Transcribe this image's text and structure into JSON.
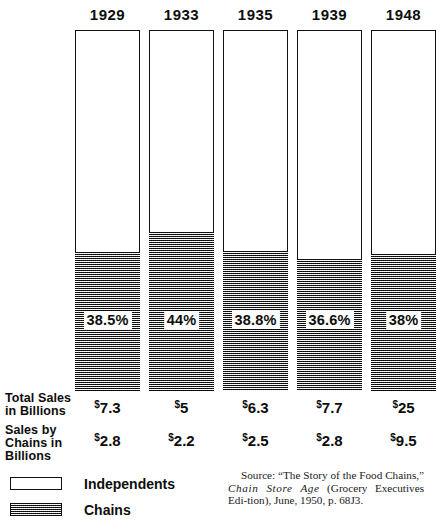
{
  "chart_data": {
    "type": "bar",
    "title": "",
    "xlabel": "",
    "ylabel": "",
    "categories": [
      "1929",
      "1933",
      "1935",
      "1939",
      "1948"
    ],
    "series": [
      {
        "name": "Independents",
        "note": "unshaded upper portion of each bar",
        "values": [
          61.5,
          56.0,
          61.2,
          63.4,
          62.0
        ]
      },
      {
        "name": "Chains",
        "note": "stippled lower portion of each bar, labelled with percent",
        "values": [
          38.5,
          44.0,
          38.8,
          36.6,
          38.0
        ]
      }
    ],
    "percent_labels": [
      "38.5%",
      "44%",
      "38.8%",
      "36.6%",
      "38%"
    ],
    "ylim": [
      0,
      100
    ],
    "grid": false,
    "legend_position": "bottom-left",
    "total_sales_billions": [
      "$7.3",
      "$5",
      "$6.3",
      "$7.7",
      "$25"
    ],
    "chain_sales_billions": [
      "$2.8",
      "$2.2",
      "$2.5",
      "$2.8",
      "$9.5"
    ]
  },
  "columns": [
    {
      "year": "1929",
      "pct": "38.5%",
      "fill_pct": 38.5,
      "total": "7.3",
      "chains": "2.8"
    },
    {
      "year": "1933",
      "pct": "44%",
      "fill_pct": 44.0,
      "total": "5",
      "chains": "2.2"
    },
    {
      "year": "1935",
      "pct": "38.8%",
      "fill_pct": 38.8,
      "total": "6.3",
      "chains": "2.5"
    },
    {
      "year": "1939",
      "pct": "36.6%",
      "fill_pct": 36.6,
      "total": "7.7",
      "chains": "2.8"
    },
    {
      "year": "1948",
      "pct": "38%",
      "fill_pct": 38.0,
      "total": "25",
      "chains": "9.5"
    }
  ],
  "row_labels": {
    "total_line1": "Total Sales",
    "total_line2": "in Billions",
    "chains_line1": "Sales by",
    "chains_line2": "Chains in",
    "chains_line3": "Billions"
  },
  "currency_symbol": "$",
  "legend": {
    "items": [
      {
        "label": "Independents",
        "style": "open"
      },
      {
        "label": "Chains",
        "style": "hatched"
      }
    ]
  },
  "source": {
    "line1": "Source: “The Story of the Food Chains,”",
    "line2_italic": "Chain Store Age",
    "line2_rest": " (Grocery Executives Edi-",
    "line3": "tion), June, 1950, p. 68J3."
  },
  "colors": {
    "ink": "#111111",
    "paper": "#ffffff",
    "hatch": "#9a9a9a"
  }
}
